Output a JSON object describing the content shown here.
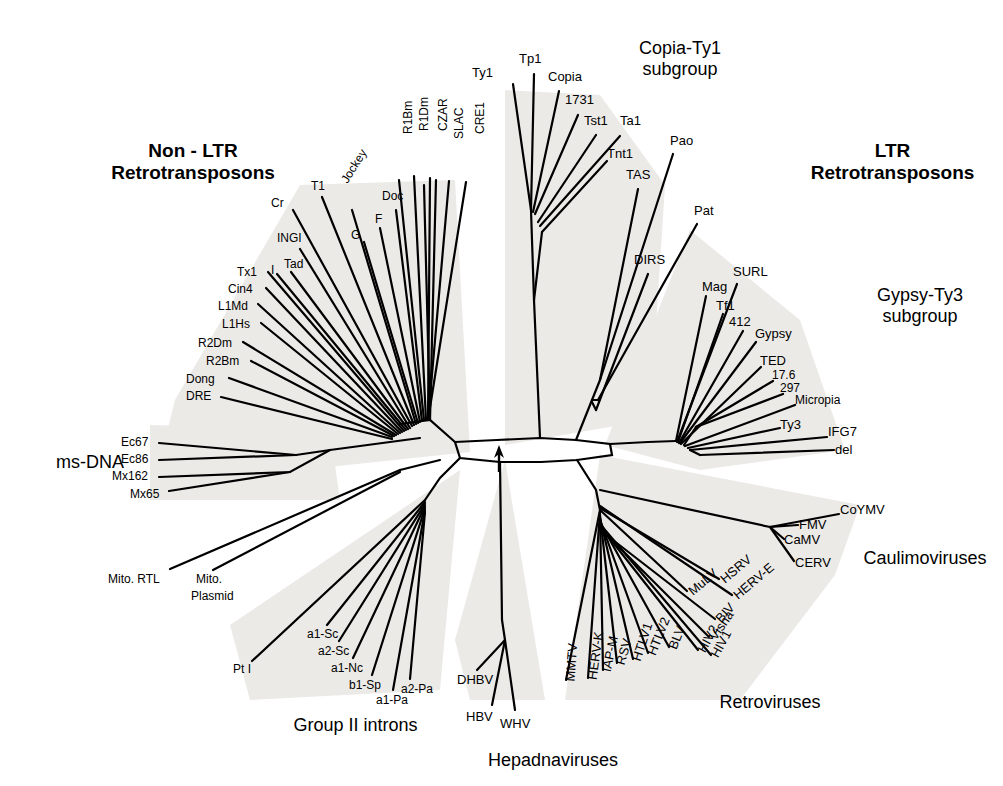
{
  "figure": {
    "type": "unrooted-phylogenetic-tree",
    "root_marker": "arrow"
  },
  "group_labels": [
    {
      "key": "non_ltr",
      "line1": "Non - LTR",
      "line2": "Retrotransposons",
      "bold": true,
      "x": 88,
      "y": 140,
      "w": 210
    },
    {
      "key": "ltr",
      "line1": "LTR",
      "line2": "Retrotransposons",
      "bold": true,
      "x": 790,
      "y": 140,
      "w": 205
    },
    {
      "key": "copia_ty1",
      "line1": "Copia-Ty1",
      "line2": "subgroup",
      "bold": false,
      "x": 600,
      "y": 38,
      "w": 160
    },
    {
      "key": "gypsy_ty3",
      "line1": "Gypsy-Ty3",
      "line2": "subgroup",
      "bold": false,
      "x": 845,
      "y": 285,
      "w": 150
    },
    {
      "key": "ms_dna",
      "line1": "ms-DNA",
      "line2": "",
      "bold": false,
      "x": 35,
      "y": 452,
      "w": 110
    },
    {
      "key": "caulimoviruses",
      "line1": "Caulimoviruses",
      "line2": "",
      "bold": false,
      "x": 845,
      "y": 548,
      "w": 160
    },
    {
      "key": "retroviruses",
      "line1": "Retroviruses",
      "line2": "",
      "bold": false,
      "x": 700,
      "y": 692,
      "w": 140
    },
    {
      "key": "group_ii",
      "line1": "Group II introns",
      "line2": "",
      "bold": false,
      "x": 268,
      "y": 715,
      "w": 175
    },
    {
      "key": "hepadnaviruses",
      "line1": "Hepadnaviruses",
      "line2": "",
      "bold": false,
      "x": 468,
      "y": 750,
      "w": 170
    }
  ],
  "taxa": [
    {
      "name": "Ty1",
      "x": 493,
      "y": 66,
      "anchor": "end",
      "rot": 0,
      "tip_x": 513,
      "tip_y": 82,
      "fs": 13
    },
    {
      "name": "Tp1",
      "x": 519,
      "y": 52,
      "anchor": "start",
      "rot": 0,
      "tip_x": 533,
      "tip_y": 72,
      "fs": 13
    },
    {
      "name": "Copia",
      "x": 548,
      "y": 70,
      "anchor": "start",
      "rot": 0,
      "tip_x": 558,
      "tip_y": 89,
      "fs": 13
    },
    {
      "name": "1731",
      "x": 565,
      "y": 93,
      "anchor": "start",
      "rot": 0,
      "tip_x": 577,
      "tip_y": 113,
      "fs": 13
    },
    {
      "name": "Tst1",
      "x": 584,
      "y": 114,
      "anchor": "start",
      "rot": 0,
      "tip_x": 594,
      "tip_y": 133,
      "fs": 13
    },
    {
      "name": "Ta1",
      "x": 620,
      "y": 114,
      "anchor": "start",
      "rot": 0,
      "tip_x": 618,
      "tip_y": 133,
      "fs": 13
    },
    {
      "name": "Tnt1",
      "x": 607,
      "y": 147,
      "anchor": "start",
      "rot": 0,
      "tip_x": 606,
      "tip_y": 159,
      "fs": 13
    },
    {
      "name": "TAS",
      "x": 626,
      "y": 168,
      "anchor": "start",
      "rot": 0,
      "tip_x": 636,
      "tip_y": 187,
      "fs": 13
    },
    {
      "name": "Pao",
      "x": 670,
      "y": 134,
      "anchor": "start",
      "rot": 0,
      "tip_x": 672,
      "tip_y": 152,
      "fs": 13
    },
    {
      "name": "Pat",
      "x": 694,
      "y": 204,
      "anchor": "start",
      "rot": 0,
      "tip_x": 696,
      "tip_y": 222,
      "fs": 13
    },
    {
      "name": "DIRS",
      "x": 634,
      "y": 253,
      "anchor": "start",
      "rot": 0,
      "tip_x": 646,
      "tip_y": 272,
      "fs": 13
    },
    {
      "name": "Mag",
      "x": 702,
      "y": 280,
      "anchor": "start",
      "rot": 0,
      "tip_x": 706,
      "tip_y": 295,
      "fs": 13
    },
    {
      "name": "SURL",
      "x": 733,
      "y": 265,
      "anchor": "start",
      "rot": 0,
      "tip_x": 736,
      "tip_y": 283,
      "fs": 13
    },
    {
      "name": "Tf1",
      "x": 716,
      "y": 299,
      "anchor": "start",
      "rot": 0,
      "tip_x": 722,
      "tip_y": 313,
      "fs": 13
    },
    {
      "name": "412",
      "x": 729,
      "y": 315,
      "anchor": "start",
      "rot": 0,
      "tip_x": 742,
      "tip_y": 330,
      "fs": 13
    },
    {
      "name": "Gypsy",
      "x": 755,
      "y": 327,
      "anchor": "start",
      "rot": 0,
      "tip_x": 755,
      "tip_y": 341,
      "fs": 13
    },
    {
      "name": "TED",
      "x": 760,
      "y": 354,
      "anchor": "start",
      "rot": 0,
      "tip_x": 760,
      "tip_y": 366,
      "fs": 13
    },
    {
      "name": "17.6",
      "x": 772,
      "y": 369,
      "anchor": "start",
      "rot": 0,
      "tip_x": 772,
      "tip_y": 380,
      "fs": 12
    },
    {
      "name": "297",
      "x": 780,
      "y": 382,
      "anchor": "start",
      "rot": 0,
      "tip_x": 782,
      "tip_y": 393,
      "fs": 12
    },
    {
      "name": "Micropia",
      "x": 795,
      "y": 394,
      "anchor": "start",
      "rot": 0,
      "tip_x": 794,
      "tip_y": 404,
      "fs": 12
    },
    {
      "name": "Ty3",
      "x": 780,
      "y": 418,
      "anchor": "start",
      "rot": 0,
      "tip_x": 779,
      "tip_y": 427,
      "fs": 13
    },
    {
      "name": "IFG7",
      "x": 828,
      "y": 425,
      "anchor": "start",
      "rot": 0,
      "tip_x": 826,
      "tip_y": 436,
      "fs": 13
    },
    {
      "name": "del",
      "x": 835,
      "y": 443,
      "anchor": "start",
      "rot": 0,
      "tip_x": 833,
      "tip_y": 449,
      "fs": 13
    },
    {
      "name": "CoYMV",
      "x": 840,
      "y": 503,
      "anchor": "start",
      "rot": 0,
      "tip_x": 838,
      "tip_y": 513,
      "fs": 13
    },
    {
      "name": "FMV",
      "x": 799,
      "y": 518,
      "anchor": "start",
      "rot": 0,
      "tip_x": 797,
      "tip_y": 524,
      "fs": 13
    },
    {
      "name": "CaMV",
      "x": 784,
      "y": 533,
      "anchor": "start",
      "rot": 0,
      "tip_x": 783,
      "tip_y": 538,
      "fs": 13
    },
    {
      "name": "CERV",
      "x": 795,
      "y": 556,
      "anchor": "start",
      "rot": 0,
      "tip_x": 793,
      "tip_y": 560,
      "fs": 13
    },
    {
      "name": "HSRV",
      "x": 722,
      "y": 574,
      "anchor": "start",
      "rot": -40,
      "tip_x": 718,
      "tip_y": 578,
      "fs": 13
    },
    {
      "name": "HERV-E",
      "x": 735,
      "y": 590,
      "anchor": "start",
      "rot": -40,
      "tip_x": 731,
      "tip_y": 594,
      "fs": 13
    },
    {
      "name": "MuLV",
      "x": 690,
      "y": 586,
      "anchor": "start",
      "rot": -40,
      "tip_x": 686,
      "tip_y": 590,
      "fs": 13
    },
    {
      "name": "BIV",
      "x": 718,
      "y": 614,
      "anchor": "start",
      "rot": -48,
      "tip_x": 714,
      "tip_y": 618,
      "fs": 13
    },
    {
      "name": "Visna",
      "x": 712,
      "y": 632,
      "anchor": "start",
      "rot": -55,
      "tip_x": 708,
      "tip_y": 636,
      "fs": 13
    },
    {
      "name": "HIV2",
      "x": 701,
      "y": 645,
      "anchor": "start",
      "rot": -62,
      "tip_x": 697,
      "tip_y": 649,
      "fs": 13
    },
    {
      "name": "HIV1",
      "x": 714,
      "y": 650,
      "anchor": "start",
      "rot": -62,
      "tip_x": 710,
      "tip_y": 654,
      "fs": 13
    },
    {
      "name": "BLV",
      "x": 672,
      "y": 642,
      "anchor": "start",
      "rot": -68,
      "tip_x": 668,
      "tip_y": 646,
      "fs": 13
    },
    {
      "name": "HTLV2",
      "x": 651,
      "y": 648,
      "anchor": "start",
      "rot": -68,
      "tip_x": 647,
      "tip_y": 652,
      "fs": 13
    },
    {
      "name": "HTLV1",
      "x": 636,
      "y": 654,
      "anchor": "start",
      "rot": -72,
      "tip_x": 632,
      "tip_y": 658,
      "fs": 13
    },
    {
      "name": "RSV",
      "x": 620,
      "y": 658,
      "anchor": "start",
      "rot": -74,
      "tip_x": 616,
      "tip_y": 662,
      "fs": 13
    },
    {
      "name": "IAP-M",
      "x": 606,
      "y": 665,
      "anchor": "start",
      "rot": -78,
      "tip_x": 602,
      "tip_y": 669,
      "fs": 13
    },
    {
      "name": "HERV-K",
      "x": 592,
      "y": 673,
      "anchor": "start",
      "rot": -82,
      "tip_x": 588,
      "tip_y": 677,
      "fs": 13
    },
    {
      "name": "MMTV",
      "x": 570,
      "y": 675,
      "anchor": "start",
      "rot": -86,
      "tip_x": 566,
      "tip_y": 679,
      "fs": 13
    },
    {
      "name": "DHBV",
      "x": 457,
      "y": 673,
      "anchor": "start",
      "rot": 0,
      "tip_x": 476,
      "tip_y": 669,
      "fs": 13
    },
    {
      "name": "HBV",
      "x": 466,
      "y": 710,
      "anchor": "start",
      "rot": 0,
      "tip_x": 486,
      "tip_y": 704,
      "fs": 13
    },
    {
      "name": "WHV",
      "x": 500,
      "y": 717,
      "anchor": "start",
      "rot": 0,
      "tip_x": 510,
      "tip_y": 710,
      "fs": 13
    },
    {
      "name": "a2-Pa",
      "x": 401,
      "y": 683,
      "anchor": "start",
      "rot": 0,
      "tip_x": 409,
      "tip_y": 678,
      "fs": 12
    },
    {
      "name": "a1-Pa",
      "x": 376,
      "y": 694,
      "anchor": "start",
      "rot": 0,
      "tip_x": 392,
      "tip_y": 689,
      "fs": 12
    },
    {
      "name": "b1-Sp",
      "x": 349,
      "y": 679,
      "anchor": "start",
      "rot": 0,
      "tip_x": 371,
      "tip_y": 674,
      "fs": 12
    },
    {
      "name": "a1-Nc",
      "x": 331,
      "y": 662,
      "anchor": "start",
      "rot": 0,
      "tip_x": 352,
      "tip_y": 657,
      "fs": 12
    },
    {
      "name": "a2-Sc",
      "x": 318,
      "y": 645,
      "anchor": "start",
      "rot": 0,
      "tip_x": 338,
      "tip_y": 640,
      "fs": 12
    },
    {
      "name": "a1-Sc",
      "x": 307,
      "y": 628,
      "anchor": "start",
      "rot": 0,
      "tip_x": 326,
      "tip_y": 624,
      "fs": 12
    },
    {
      "name": "Pt I",
      "x": 233,
      "y": 663,
      "anchor": "start",
      "rot": 0,
      "tip_x": 252,
      "tip_y": 660,
      "fs": 12
    },
    {
      "name": "Mito. RTL",
      "x": 108,
      "y": 573,
      "anchor": "start",
      "rot": 0,
      "tip_x": 170,
      "tip_y": 568,
      "fs": 12
    },
    {
      "name": "Mito.",
      "x": 196,
      "y": 573,
      "anchor": "start",
      "rot": 0,
      "tip_x": 212,
      "tip_y": 568,
      "fs": 12
    },
    {
      "name": "Plasmid",
      "x": 191,
      "y": 590,
      "anchor": "start",
      "rot": 0,
      "tip_x": 191,
      "tip_y": 590,
      "fs": 12
    },
    {
      "name": "Ec67",
      "x": 121,
      "y": 436,
      "anchor": "start",
      "rot": 0,
      "tip_x": 158,
      "tip_y": 442,
      "fs": 12
    },
    {
      "name": "Ec86",
      "x": 121,
      "y": 453,
      "anchor": "start",
      "rot": 0,
      "tip_x": 158,
      "tip_y": 459,
      "fs": 12
    },
    {
      "name": "Mx162",
      "x": 112,
      "y": 470,
      "anchor": "start",
      "rot": 0,
      "tip_x": 158,
      "tip_y": 476,
      "fs": 12
    },
    {
      "name": "Mx65",
      "x": 130,
      "y": 488,
      "anchor": "start",
      "rot": 0,
      "tip_x": 168,
      "tip_y": 490,
      "fs": 12
    },
    {
      "name": "DRE",
      "x": 186,
      "y": 390,
      "anchor": "start",
      "rot": 0,
      "tip_x": 222,
      "tip_y": 396,
      "fs": 12
    },
    {
      "name": "Dong",
      "x": 186,
      "y": 373,
      "anchor": "start",
      "rot": 0,
      "tip_x": 230,
      "tip_y": 377,
      "fs": 12
    },
    {
      "name": "R2Bm",
      "x": 206,
      "y": 355,
      "anchor": "start",
      "rot": 0,
      "tip_x": 252,
      "tip_y": 360,
      "fs": 12
    },
    {
      "name": "R2Dm",
      "x": 198,
      "y": 337,
      "anchor": "start",
      "rot": 0,
      "tip_x": 244,
      "tip_y": 341,
      "fs": 12
    },
    {
      "name": "L1Hs",
      "x": 222,
      "y": 318,
      "anchor": "start",
      "rot": 0,
      "tip_x": 262,
      "tip_y": 322,
      "fs": 12
    },
    {
      "name": "L1Md",
      "x": 218,
      "y": 300,
      "anchor": "start",
      "rot": 0,
      "tip_x": 258,
      "tip_y": 303,
      "fs": 12
    },
    {
      "name": "Cin4",
      "x": 228,
      "y": 283,
      "anchor": "start",
      "rot": 0,
      "tip_x": 266,
      "tip_y": 287,
      "fs": 12
    },
    {
      "name": "Tx1",
      "x": 237,
      "y": 266,
      "anchor": "start",
      "rot": 0,
      "tip_x": 268,
      "tip_y": 271,
      "fs": 12
    },
    {
      "name": "I",
      "x": 271,
      "y": 264,
      "anchor": "start",
      "rot": 0,
      "tip_x": 276,
      "tip_y": 273,
      "fs": 12
    },
    {
      "name": "Tad",
      "x": 284,
      "y": 258,
      "anchor": "start",
      "rot": 0,
      "tip_x": 289,
      "tip_y": 271,
      "fs": 12
    },
    {
      "name": "INGI",
      "x": 277,
      "y": 232,
      "anchor": "start",
      "rot": 0,
      "tip_x": 300,
      "tip_y": 247,
      "fs": 12
    },
    {
      "name": "Cr",
      "x": 271,
      "y": 197,
      "anchor": "start",
      "rot": 0,
      "tip_x": 292,
      "tip_y": 208,
      "fs": 12
    },
    {
      "name": "T1",
      "x": 311,
      "y": 180,
      "anchor": "start",
      "rot": 0,
      "tip_x": 321,
      "tip_y": 195,
      "fs": 12
    },
    {
      "name": "Jockey",
      "x": 344,
      "y": 176,
      "anchor": "start",
      "rot": -58,
      "tip_x": 352,
      "tip_y": 206,
      "fs": 12
    },
    {
      "name": "G",
      "x": 351,
      "y": 229,
      "anchor": "start",
      "rot": 0,
      "tip_x": 362,
      "tip_y": 239,
      "fs": 12
    },
    {
      "name": "F",
      "x": 375,
      "y": 213,
      "anchor": "start",
      "rot": 0,
      "tip_x": 380,
      "tip_y": 225,
      "fs": 12
    },
    {
      "name": "Doc",
      "x": 382,
      "y": 190,
      "anchor": "start",
      "rot": 0,
      "tip_x": 395,
      "tip_y": 206,
      "fs": 12
    },
    {
      "name": "R1Bm",
      "x": 408,
      "y": 128,
      "anchor": "start",
      "rot": -90,
      "tip_x": 411,
      "tip_y": 176,
      "fs": 12
    },
    {
      "name": "R1Dm",
      "x": 424,
      "y": 125,
      "anchor": "start",
      "rot": -90,
      "tip_x": 427,
      "tip_y": 172,
      "fs": 12
    },
    {
      "name": "CZAR",
      "x": 443,
      "y": 125,
      "anchor": "start",
      "rot": -90,
      "tip_x": 446,
      "tip_y": 172,
      "fs": 12
    },
    {
      "name": "SLAC",
      "x": 459,
      "y": 133,
      "anchor": "start",
      "rot": -90,
      "tip_x": 462,
      "tip_y": 180,
      "fs": 12
    },
    {
      "name": "CRE1",
      "x": 480,
      "y": 128,
      "anchor": "start",
      "rot": -90,
      "tip_x": 483,
      "tip_y": 176,
      "fs": 12
    }
  ],
  "shade_color": "#ecebe9",
  "line_color": "#000000"
}
